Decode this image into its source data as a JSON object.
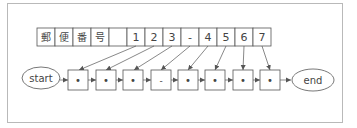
{
  "diagram": {
    "title_cells": [
      "郵",
      "便",
      "番",
      "号",
      "",
      "1",
      "2",
      "3",
      "-",
      "4",
      "5",
      "6",
      "7"
    ],
    "start_label": "start",
    "end_label": "end",
    "nodes": [
      "•",
      "•",
      "•",
      "-",
      "•",
      "•",
      "•",
      "•"
    ],
    "links": [
      {
        "from_cell": 5,
        "to_node": 0
      },
      {
        "from_cell": 6,
        "to_node": 1
      },
      {
        "from_cell": 7,
        "to_node": 2
      },
      {
        "from_cell": 8,
        "to_node": 3
      },
      {
        "from_cell": 9,
        "to_node": 4
      },
      {
        "from_cell": 10,
        "to_node": 5
      },
      {
        "from_cell": 11,
        "to_node": 6
      },
      {
        "from_cell": 12,
        "to_node": 7
      }
    ],
    "colors": {
      "stroke": "#555555",
      "frame": "#b9b9b9",
      "text": "#444444"
    }
  }
}
